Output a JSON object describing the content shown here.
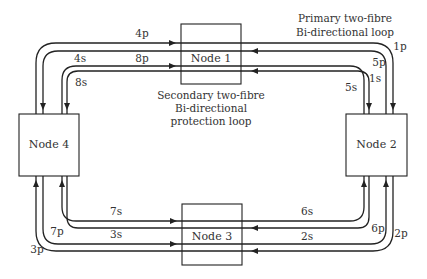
{
  "diagram": {
    "nodes": [
      {
        "id": "node1",
        "label": "Node 1"
      },
      {
        "id": "node2",
        "label": "Node 2"
      },
      {
        "id": "node3",
        "label": "Node 3"
      },
      {
        "id": "node4",
        "label": "Node 4"
      }
    ],
    "captions": {
      "primary_line1": "Primary two-fibre",
      "primary_line2": "Bi-directional loop",
      "secondary_line1": "Secondary two-fibre",
      "secondary_line2": "Bi-directional",
      "secondary_line3": "protection loop"
    },
    "fibre_labels": {
      "l1p": "1p",
      "l2p": "2p",
      "l3p": "3p",
      "l4p": "4p",
      "l5p": "5p",
      "l6p": "6p",
      "l7p": "7p",
      "l8p": "8p",
      "l1s": "1s",
      "l2s": "2s",
      "l3s": "3s",
      "l4s": "4s",
      "l5s": "5s",
      "l6s": "6s",
      "l7s": "7s",
      "l8s": "8s"
    },
    "colors": {
      "line": "#222222",
      "text": "#333333",
      "background": "#ffffff"
    }
  }
}
